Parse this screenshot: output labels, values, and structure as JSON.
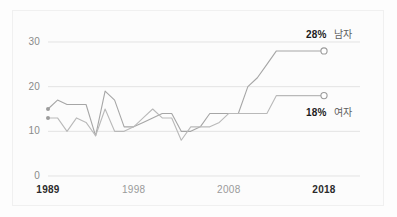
{
  "chart_data": {
    "type": "line",
    "title": "",
    "subtitle": "",
    "xlabel": "",
    "ylabel": "",
    "xlim": [
      1989,
      2018
    ],
    "ylim": [
      0,
      32
    ],
    "yticks": [
      0,
      10,
      20,
      30
    ],
    "xticks": [
      1989,
      1998,
      2008,
      2018
    ],
    "xtick_labels": [
      "1989",
      "1998",
      "2008",
      "2018"
    ],
    "xtick_bold": [
      true,
      false,
      false,
      true
    ],
    "grid": true,
    "grid_axis": "y",
    "legend_position": "right-end-of-line",
    "x": [
      1989,
      1990,
      1991,
      1992,
      1993,
      1994,
      1995,
      1996,
      1997,
      1998,
      1999,
      2000,
      2001,
      2002,
      2003,
      2004,
      2005,
      2006,
      2007,
      2008,
      2009,
      2010,
      2011,
      2012,
      2013,
      2014,
      2015,
      2016,
      2017,
      2018
    ],
    "series": [
      {
        "name": "남자",
        "end_label": "28%",
        "end_value": 28,
        "start_value": 15,
        "color": "#a6a6a6",
        "values": [
          15,
          17,
          16,
          16,
          16,
          9,
          19,
          17,
          11,
          11,
          12,
          13,
          14,
          14,
          10,
          10,
          11,
          14,
          14,
          14,
          14,
          20,
          22,
          25,
          28,
          28,
          28,
          28,
          28,
          28
        ]
      },
      {
        "name": "여자",
        "end_label": "18%",
        "end_value": 18,
        "start_value": 13,
        "color": "#b9b9b9",
        "values": [
          13,
          13,
          10,
          13,
          12,
          9,
          15,
          10,
          10,
          11,
          13,
          15,
          13,
          13,
          8,
          11,
          11,
          11,
          12,
          14,
          14,
          14,
          14,
          14,
          18,
          18,
          18,
          18,
          18,
          18
        ]
      }
    ],
    "markers": {
      "start": "filled-dot",
      "end": "open-circle"
    }
  }
}
